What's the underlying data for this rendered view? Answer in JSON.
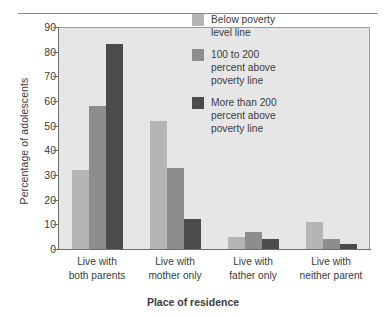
{
  "chart_data": {
    "type": "bar",
    "title": "",
    "xlabel": "Place of residence",
    "ylabel": "Percentage of adolescents",
    "ylim": [
      0,
      90
    ],
    "yticks": [
      0,
      10,
      20,
      30,
      40,
      50,
      60,
      70,
      80,
      90
    ],
    "grid": false,
    "legend_position": "inside-top-right",
    "categories": [
      "Live with\nboth parents",
      "Live with\nmother only",
      "Live with\nfather only",
      "Live with\nneither parent"
    ],
    "category_lines": [
      [
        "Live with",
        "both parents"
      ],
      [
        "Live with",
        "mother only"
      ],
      [
        "Live with",
        "father only"
      ],
      [
        "Live with",
        "neither parent"
      ]
    ],
    "series": [
      {
        "name": "Below poverty level line",
        "name_lines": [
          "Below poverty",
          "level line"
        ],
        "color": "#b5b5b5",
        "values": [
          32,
          52,
          5,
          11
        ]
      },
      {
        "name": "100 to 200 percent above poverty line",
        "name_lines": [
          "100 to 200",
          "percent above",
          "poverty line"
        ],
        "color": "#8d8d8d",
        "values": [
          58,
          33,
          7,
          4
        ]
      },
      {
        "name": "More than 200 percent above poverty line",
        "name_lines": [
          "More than 200",
          "percent above",
          "poverty line"
        ],
        "color": "#4b4b4b",
        "values": [
          83,
          12,
          4,
          2
        ]
      }
    ]
  },
  "axis": {
    "ytick_labels": [
      "90",
      "80",
      "70",
      "60",
      "50",
      "40",
      "30",
      "20",
      "10",
      "0"
    ],
    "ylabel": "Percentage of adolescents",
    "xlabel": "Place of residence"
  },
  "legend": {
    "items": [
      {
        "l0": "Below poverty",
        "l1": "level line",
        "l2": ""
      },
      {
        "l0": "100 to 200",
        "l1": "percent above",
        "l2": "poverty line"
      },
      {
        "l0": "More than 200",
        "l1": "percent above",
        "l2": "poverty line"
      }
    ]
  },
  "xticks": [
    {
      "l0": "Live with",
      "l1": "both parents"
    },
    {
      "l0": "Live with",
      "l1": "mother only"
    },
    {
      "l0": "Live with",
      "l1": "father only"
    },
    {
      "l0": "Live with",
      "l1": "neither parent"
    }
  ]
}
